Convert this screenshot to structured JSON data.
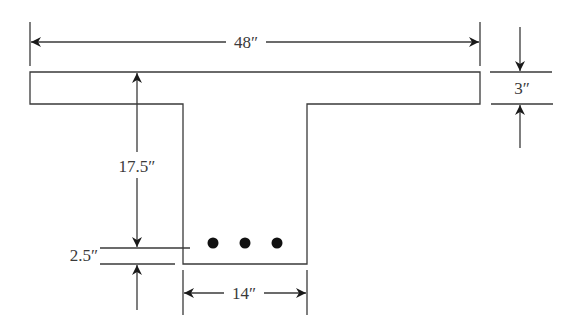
{
  "figure": {
    "dimensions": {
      "flange_width": "48″",
      "flange_thickness": "3″",
      "effective_depth_to_steel": "17.5″",
      "cover_to_steel_centroid": "2.5″",
      "web_width": "14″"
    },
    "reinforcement": {
      "bar_count": 3,
      "bar_color": "#111111"
    },
    "line_color": "#3a3a3a"
  }
}
